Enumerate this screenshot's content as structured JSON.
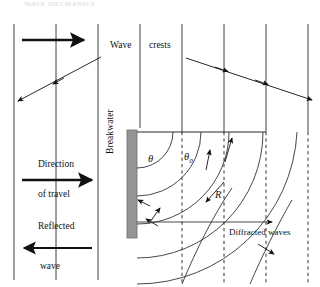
{
  "figure": {
    "page_header": "WAVE MECHANICS",
    "labels": {
      "wave_crests_word1": "Wave",
      "wave_crests_word2": "crests",
      "direction": "Direction",
      "of_travel": "of travel",
      "reflected": "Reflected",
      "wave": "wave",
      "breakwater": "Breakwater",
      "diffracted_waves": "Diffracted waves",
      "theta": "θ",
      "theta0_base": "θ",
      "theta0_sub": "0",
      "radius": "R"
    },
    "colors": {
      "ink": "#111111",
      "breakwater_fill": "#949494",
      "breakwater_stroke": "#6f6f6f",
      "crest_line": "#2b2b2b",
      "background": "#ffffff"
    },
    "geometry": {
      "wave_crest_x_positions": [
        14,
        56,
        98,
        140,
        182,
        224,
        266,
        308
      ],
      "breakwater": {
        "x": 127,
        "y": 130,
        "width": 10,
        "height": 108
      },
      "diffraction_origin": {
        "x": 137,
        "y": 132
      },
      "arc_radii": [
        36,
        64,
        92,
        126,
        160
      ],
      "shadow_dashed_x": [
        182,
        224,
        266,
        308
      ],
      "incident_ray_angle_deg": 27,
      "reflected_ray_angle_deg": -27
    },
    "annotations": {
      "incident_arrow": "right-pointing-bold-arrow",
      "reflected_arrow": "left-pointing-bold-arrow",
      "direction_arrow": "right-pointing-bold-arrow"
    }
  }
}
